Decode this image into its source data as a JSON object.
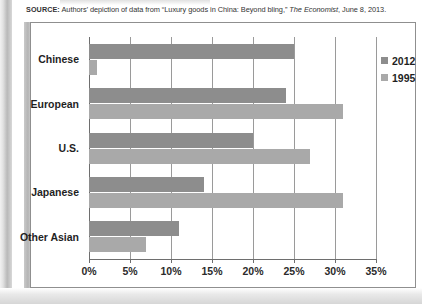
{
  "source": {
    "label": "SOURCE:",
    "text_before": " Authors’ depiction of data from “Luxury goods in China: Beyond bling,” ",
    "publication": "The Economist",
    "text_after": ", June 8, 2013."
  },
  "legend": {
    "position": "top-right-inside",
    "items": [
      {
        "label": "2012",
        "color": "#8d8d8d"
      },
      {
        "label": "1995",
        "color": "#a9a9a9"
      }
    ]
  },
  "axis": {
    "x_ticks": [
      "0%",
      "5%",
      "10%",
      "15%",
      "20%",
      "25%",
      "30%",
      "35%"
    ],
    "x_tick_values": [
      0,
      5,
      10,
      15,
      20,
      25,
      30,
      35
    ],
    "x_min": 0,
    "x_max": 35
  },
  "chart_data": {
    "type": "bar",
    "orientation": "horizontal",
    "title": "",
    "subtitle": "",
    "xlabel": "",
    "ylabel": "",
    "xlim": [
      0,
      35
    ],
    "grid": true,
    "legend_position": "top-right",
    "categories": [
      "Chinese",
      "European",
      "U.S.",
      "Japanese",
      "Other Asian"
    ],
    "tick_labels": [
      "0%",
      "5%",
      "10%",
      "15%",
      "20%",
      "25%",
      "30%",
      "35%"
    ],
    "units": "percent",
    "series": [
      {
        "name": "2012",
        "color": "#8d8d8d",
        "values": [
          25,
          24,
          20,
          14,
          11
        ]
      },
      {
        "name": "1995",
        "color": "#a9a9a9",
        "values": [
          1,
          31,
          27,
          31,
          7
        ]
      }
    ]
  }
}
